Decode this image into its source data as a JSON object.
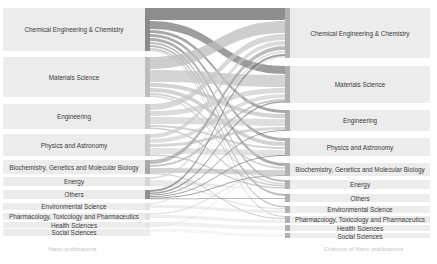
{
  "chart_data": {
    "type": "sankey",
    "title": "",
    "left_axis_label": "Nano-publications",
    "right_axis_label": "Citations of Nano-publications",
    "left_nodes": [
      {
        "label": "Chemical Engineering & Chemistry",
        "y0": 8,
        "y1": 51,
        "bar_color": "#8a8a8a"
      },
      {
        "label": "Materials Science",
        "y0": 57,
        "y1": 97,
        "bar_color": "#bdbdbd"
      },
      {
        "label": "Engineering",
        "y0": 104,
        "y1": 129,
        "bar_color": "#c8c8c8"
      },
      {
        "label": "Physics and Astronomy",
        "y0": 134,
        "y1": 156,
        "bar_color": "#c8c8c8"
      },
      {
        "label": "Biochemistry, Genetics and Molecular Biology",
        "y0": 160,
        "y1": 174,
        "bar_color": "#a8a8a8"
      },
      {
        "label": "Energy",
        "y0": 177,
        "y1": 186,
        "bar_color": "#d6d6d6"
      },
      {
        "label": "Others",
        "y0": 190,
        "y1": 199,
        "bar_color": "#8f8f8f"
      },
      {
        "label": "Environmental Science",
        "y0": 203,
        "y1": 210,
        "bar_color": "#e2e2e2"
      },
      {
        "label": "Pharmacology, Toxicology and Pharmaceutics",
        "y0": 213,
        "y1": 220,
        "bar_color": "#e2e2e2"
      },
      {
        "label": "Health Sciences",
        "y0": 222,
        "y1": 228,
        "bar_color": "#e6e6e6"
      },
      {
        "label": "Social Sciences",
        "y0": 229,
        "y1": 236,
        "bar_color": "#ececec"
      }
    ],
    "right_nodes": [
      {
        "label": "Chemical Engineering & Chemistry",
        "y0": 8,
        "y1": 58
      },
      {
        "label": "Materials Science",
        "y0": 66,
        "y1": 103
      },
      {
        "label": "Engineering",
        "y0": 110,
        "y1": 131
      },
      {
        "label": "Physics and Astronomy",
        "y0": 138,
        "y1": 156
      },
      {
        "label": "Biochemistry, Genetics and Molecular Biology",
        "y0": 163,
        "y1": 176
      },
      {
        "label": "Energy",
        "y0": 180,
        "y1": 189
      },
      {
        "label": "Others",
        "y0": 194,
        "y1": 202
      },
      {
        "label": "Environmental Science",
        "y0": 206,
        "y1": 213
      },
      {
        "label": "Pharmacology, Toxicology and Pharmaceutics",
        "y0": 216,
        "y1": 223
      },
      {
        "label": "Health Sciences",
        "y0": 225,
        "y1": 231
      },
      {
        "label": "Social Sciences",
        "y0": 233,
        "y1": 238
      }
    ],
    "links": [
      {
        "source": 0,
        "target": 0,
        "sy": 8,
        "sh": 12,
        "ty": 8,
        "th": 12,
        "color": "#7a7a7a",
        "opacity": 0.85
      },
      {
        "source": 0,
        "target": 1,
        "sy": 21,
        "sh": 8,
        "ty": 66,
        "th": 8,
        "color": "#858585",
        "opacity": 0.8
      },
      {
        "source": 0,
        "target": 2,
        "sy": 30,
        "sh": 3,
        "ty": 110,
        "th": 3,
        "color": "#8a8a8a",
        "opacity": 0.75
      },
      {
        "source": 0,
        "target": 3,
        "sy": 34,
        "sh": 3,
        "ty": 138,
        "th": 3,
        "color": "#8a8a8a",
        "opacity": 0.7
      },
      {
        "source": 0,
        "target": 4,
        "sy": 38,
        "sh": 3,
        "ty": 163,
        "th": 3,
        "color": "#8a8a8a",
        "opacity": 0.7
      },
      {
        "source": 0,
        "target": 5,
        "sy": 42,
        "sh": 2,
        "ty": 180,
        "th": 2,
        "color": "#909090",
        "opacity": 0.6
      },
      {
        "source": 0,
        "target": 6,
        "sy": 45,
        "sh": 2,
        "ty": 194,
        "th": 2,
        "color": "#909090",
        "opacity": 0.6
      },
      {
        "source": 0,
        "target": 7,
        "sy": 48,
        "sh": 1.5,
        "ty": 206,
        "th": 1.5,
        "color": "#999999",
        "opacity": 0.55
      },
      {
        "source": 0,
        "target": 8,
        "sy": 50,
        "sh": 1,
        "ty": 216,
        "th": 1,
        "color": "#999999",
        "opacity": 0.5
      },
      {
        "source": 1,
        "target": 0,
        "sy": 57,
        "sh": 12,
        "ty": 21,
        "th": 12,
        "color": "#bdbdbd",
        "opacity": 0.75
      },
      {
        "source": 1,
        "target": 1,
        "sy": 70,
        "sh": 12,
        "ty": 75,
        "th": 12,
        "color": "#c2c2c2",
        "opacity": 0.7
      },
      {
        "source": 1,
        "target": 2,
        "sy": 83,
        "sh": 4,
        "ty": 114,
        "th": 4,
        "color": "#b5b5b5",
        "opacity": 0.6
      },
      {
        "source": 1,
        "target": 3,
        "sy": 88,
        "sh": 4,
        "ty": 142,
        "th": 4,
        "color": "#b5b5b5",
        "opacity": 0.6
      },
      {
        "source": 1,
        "target": 4,
        "sy": 93,
        "sh": 2,
        "ty": 167,
        "th": 2,
        "color": "#b0b0b0",
        "opacity": 0.55
      },
      {
        "source": 1,
        "target": 5,
        "sy": 95.5,
        "sh": 1.5,
        "ty": 183,
        "th": 1.5,
        "color": "#b0b0b0",
        "opacity": 0.5
      },
      {
        "source": 2,
        "target": 0,
        "sy": 104,
        "sh": 6,
        "ty": 34,
        "th": 6,
        "color": "#c8c8c8",
        "opacity": 0.7
      },
      {
        "source": 2,
        "target": 1,
        "sy": 111,
        "sh": 5,
        "ty": 88,
        "th": 5,
        "color": "#c8c8c8",
        "opacity": 0.65
      },
      {
        "source": 2,
        "target": 2,
        "sy": 117,
        "sh": 7,
        "ty": 119,
        "th": 7,
        "color": "#cdcdcd",
        "opacity": 0.65
      },
      {
        "source": 2,
        "target": 3,
        "sy": 125,
        "sh": 2,
        "ty": 147,
        "th": 2,
        "color": "#b0b0b0",
        "opacity": 0.55
      },
      {
        "source": 2,
        "target": 5,
        "sy": 127.5,
        "sh": 1.5,
        "ty": 185,
        "th": 1.5,
        "color": "#a0a0a0",
        "opacity": 0.5
      },
      {
        "source": 3,
        "target": 0,
        "sy": 134,
        "sh": 4,
        "ty": 41,
        "th": 4,
        "color": "#c8c8c8",
        "opacity": 0.65
      },
      {
        "source": 3,
        "target": 1,
        "sy": 139,
        "sh": 4,
        "ty": 94,
        "th": 4,
        "color": "#c8c8c8",
        "opacity": 0.6
      },
      {
        "source": 3,
        "target": 2,
        "sy": 144,
        "sh": 3,
        "ty": 127,
        "th": 3,
        "color": "#bdbdbd",
        "opacity": 0.6
      },
      {
        "source": 3,
        "target": 3,
        "sy": 148,
        "sh": 6,
        "ty": 150,
        "th": 6,
        "color": "#cfcfcf",
        "opacity": 0.6
      },
      {
        "source": 3,
        "target": 5,
        "sy": 154.5,
        "sh": 1.5,
        "ty": 187,
        "th": 1.5,
        "color": "#a0a0a0",
        "opacity": 0.5
      },
      {
        "source": 4,
        "target": 0,
        "sy": 160,
        "sh": 4,
        "ty": 46,
        "th": 4,
        "color": "#9a9a9a",
        "opacity": 0.65
      },
      {
        "source": 4,
        "target": 1,
        "sy": 165,
        "sh": 2,
        "ty": 99,
        "th": 2,
        "color": "#a5a5a5",
        "opacity": 0.6
      },
      {
        "source": 4,
        "target": 4,
        "sy": 168,
        "sh": 5,
        "ty": 170,
        "th": 5,
        "color": "#b5b5b5",
        "opacity": 0.6
      },
      {
        "source": 4,
        "target": 8,
        "sy": 173,
        "sh": 1,
        "ty": 218,
        "th": 1,
        "color": "#a0a0a0",
        "opacity": 0.55
      },
      {
        "source": 5,
        "target": 0,
        "sy": 177,
        "sh": 2,
        "ty": 51,
        "th": 2,
        "color": "#cdcdcd",
        "opacity": 0.6
      },
      {
        "source": 5,
        "target": 5,
        "sy": 180,
        "sh": 5,
        "ty": 189,
        "th": 0.1,
        "color": "#dadada",
        "opacity": 0.6
      },
      {
        "source": 5,
        "target": 7,
        "sy": 185,
        "sh": 1,
        "ty": 208,
        "th": 1,
        "color": "#c0c0c0",
        "opacity": 0.5
      },
      {
        "source": 6,
        "target": 0,
        "sy": 190,
        "sh": 2,
        "ty": 54,
        "th": 2,
        "color": "#7e7e7e",
        "opacity": 0.75
      },
      {
        "source": 6,
        "target": 1,
        "sy": 192.5,
        "sh": 1.5,
        "ty": 101,
        "th": 1.5,
        "color": "#7e7e7e",
        "opacity": 0.7
      },
      {
        "source": 6,
        "target": 2,
        "sy": 194.5,
        "sh": 1,
        "ty": 130,
        "th": 1,
        "color": "#7e7e7e",
        "opacity": 0.7
      },
      {
        "source": 6,
        "target": 3,
        "sy": 196,
        "sh": 1,
        "ty": 155,
        "th": 1,
        "color": "#7e7e7e",
        "opacity": 0.7
      },
      {
        "source": 6,
        "target": 4,
        "sy": 197.5,
        "sh": 1,
        "ty": 175,
        "th": 1,
        "color": "#7e7e7e",
        "opacity": 0.7
      },
      {
        "source": 6,
        "target": 6,
        "sy": 198.5,
        "sh": 0.8,
        "ty": 198,
        "th": 0.8,
        "color": "#7e7e7e",
        "opacity": 0.7
      },
      {
        "source": 7,
        "target": 0,
        "sy": 203,
        "sh": 1.5,
        "ty": 56,
        "th": 1.5,
        "color": "#d5d5d5",
        "opacity": 0.55
      },
      {
        "source": 7,
        "target": 7,
        "sy": 205,
        "sh": 3,
        "ty": 210,
        "th": 3,
        "color": "#e0e0e0",
        "opacity": 0.55
      },
      {
        "source": 8,
        "target": 4,
        "sy": 213,
        "sh": 1.5,
        "ty": 173,
        "th": 1.5,
        "color": "#d0d0d0",
        "opacity": 0.5
      },
      {
        "source": 8,
        "target": 8,
        "sy": 215,
        "sh": 3,
        "ty": 220,
        "th": 3,
        "color": "#e0e0e0",
        "opacity": 0.5
      },
      {
        "source": 9,
        "target": 9,
        "sy": 222,
        "sh": 4,
        "ty": 226,
        "th": 4,
        "color": "#e3e3e3",
        "opacity": 0.5
      },
      {
        "source": 9,
        "target": 4,
        "sy": 226,
        "sh": 1,
        "ty": 174.5,
        "th": 1,
        "color": "#d8d8d8",
        "opacity": 0.45
      },
      {
        "source": 10,
        "target": 10,
        "sy": 229,
        "sh": 3,
        "ty": 234,
        "th": 3,
        "color": "#ebebeb",
        "opacity": 0.5
      }
    ]
  },
  "labels": {
    "left_axis": "Nano-publications",
    "right_axis": "Citations of Nano-publications"
  }
}
